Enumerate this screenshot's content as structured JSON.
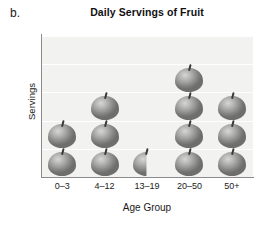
{
  "panel_label": "b.",
  "chart_data": {
    "type": "bar",
    "title": "Daily Servings of Fruit",
    "xlabel": "Age Group",
    "ylabel": "Servings",
    "categories": [
      "0–3",
      "4–12",
      "13–19",
      "20–50",
      "50+"
    ],
    "values": [
      2,
      3,
      0.5,
      4,
      3
    ],
    "unit": "apple icon = 1 serving",
    "ylim": [
      0,
      5
    ],
    "y_tick_labels": [],
    "gridlines": 5,
    "grid": true,
    "legend": false,
    "icon": "apple-icon",
    "colors": {
      "plot_background": "#f2f2f0",
      "gridline": "#ffffff",
      "axis": "#8b8b8b",
      "icon_light": "#d6d6d4",
      "icon_dark": "#6e6e6c",
      "stem": "#3a3a38",
      "text": "#1a1a1a"
    }
  }
}
